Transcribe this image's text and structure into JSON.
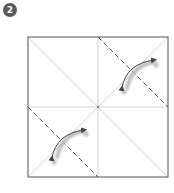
{
  "step": {
    "number": "2",
    "badge_color": "#5a5a5a"
  },
  "diagram": {
    "type": "origami-fold-step",
    "square": {
      "x": 28,
      "y": 37,
      "size": 140
    },
    "center": {
      "x": 98,
      "y": 107
    },
    "colors": {
      "border": "#6e6e6e",
      "crease": "#c8c8c8",
      "dashed": "#555555",
      "arrow": "#444444",
      "arrow_shadow": "#bdbdbd"
    },
    "creases": [
      "vertical-center",
      "horizontal-center",
      "diagonal-tl-br",
      "diagonal-tr-bl"
    ],
    "valley_folds": [
      {
        "name": "top-right-corner-fold",
        "from": [
          98,
          37
        ],
        "to": [
          168,
          107
        ]
      },
      {
        "name": "bottom-left-corner-fold",
        "from": [
          28,
          107
        ],
        "to": [
          98,
          177
        ]
      }
    ],
    "fold_arrows": [
      {
        "name": "top-right-fold-arrow",
        "direction": "corner-to-center-and-back"
      },
      {
        "name": "bottom-left-fold-arrow",
        "direction": "corner-to-center-and-back"
      }
    ]
  }
}
